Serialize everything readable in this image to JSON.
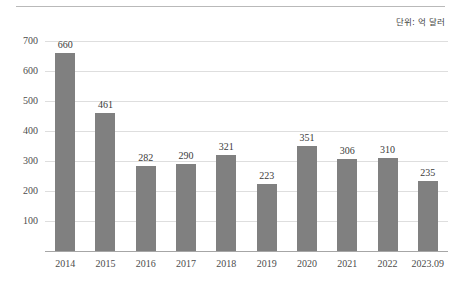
{
  "figure": {
    "unit_note": "단위: 억 달러",
    "background_color": "#ffffff",
    "rule_color": "#b9b9b9"
  },
  "chart_data": {
    "type": "bar",
    "title": "",
    "subtitle": "",
    "xlabel": "",
    "ylabel": "",
    "unit_note": "단위: 억 달러",
    "categories": [
      "2014",
      "2015",
      "2016",
      "2017",
      "2018",
      "2019",
      "2020",
      "2021",
      "2022",
      "2023.09"
    ],
    "values": [
      660,
      461,
      282,
      290,
      321,
      223,
      351,
      306,
      310,
      235
    ],
    "data_labels": [
      "660",
      "461",
      "282",
      "290",
      "321",
      "223",
      "351",
      "306",
      "310",
      "235"
    ],
    "ylim": [
      0,
      700
    ],
    "yticks": [
      100,
      200,
      300,
      400,
      500,
      600,
      700
    ],
    "ytick_labels": [
      "100",
      "200",
      "300",
      "400",
      "500",
      "600",
      "700"
    ],
    "grid": true,
    "grid_axis": "y",
    "legend": false,
    "legend_position": "none",
    "bar_color": "#808080",
    "gridline_color": "#dedede",
    "axis_color": "#a6a6a6",
    "label_color": "#4c4c4c"
  }
}
